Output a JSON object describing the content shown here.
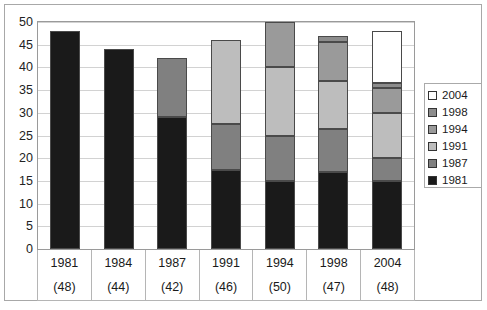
{
  "chart_data": {
    "type": "bar",
    "subtype": "stacked-vertical",
    "title": "",
    "xlabel": "",
    "ylabel": "",
    "ylim": [
      0,
      50
    ],
    "yticks": [
      0,
      5,
      10,
      15,
      20,
      25,
      30,
      35,
      40,
      45,
      50
    ],
    "ytick_labels": [
      "0",
      "5",
      "10",
      "15",
      "20",
      "25",
      "30",
      "35",
      "40",
      "45",
      "50"
    ],
    "grid": true,
    "legend_position": "right",
    "categories": [
      "1981",
      "1984",
      "1987",
      "1991",
      "1994",
      "1998",
      "2004"
    ],
    "category_totals": [
      "(48)",
      "(44)",
      "(42)",
      "(46)",
      "(50)",
      "(47)",
      "(48)"
    ],
    "totals": [
      48,
      44,
      42,
      46,
      50,
      47,
      48
    ],
    "series": [
      {
        "name": "1981",
        "color": "#1a1a1a",
        "values": [
          48,
          44,
          29,
          17.5,
          15,
          17,
          15
        ]
      },
      {
        "name": "1987",
        "color": "#808080",
        "values": [
          0,
          0,
          13,
          10,
          10,
          9.5,
          5
        ]
      },
      {
        "name": "1991",
        "color": "#bdbdbd",
        "values": [
          0,
          0,
          0,
          18.5,
          15,
          10.5,
          10
        ]
      },
      {
        "name": "1994",
        "color": "#9a9a9a",
        "values": [
          0,
          0,
          0,
          0,
          10,
          8.5,
          5.5
        ]
      },
      {
        "name": "1998",
        "color": "#8c8c8c",
        "values": [
          0,
          0,
          0,
          0,
          0,
          1.5,
          1
        ]
      },
      {
        "name": "2004",
        "color": "#ffffff",
        "values": [
          0,
          0,
          0,
          0,
          0,
          0,
          11.5
        ]
      }
    ],
    "legend_entries": [
      {
        "label": "2004",
        "color": "#ffffff"
      },
      {
        "label": "1998",
        "color": "#8c8c8c"
      },
      {
        "label": "1994",
        "color": "#9a9a9a"
      },
      {
        "label": "1991",
        "color": "#bdbdbd"
      },
      {
        "label": "1987",
        "color": "#808080"
      },
      {
        "label": "1981",
        "color": "#1a1a1a"
      }
    ]
  }
}
